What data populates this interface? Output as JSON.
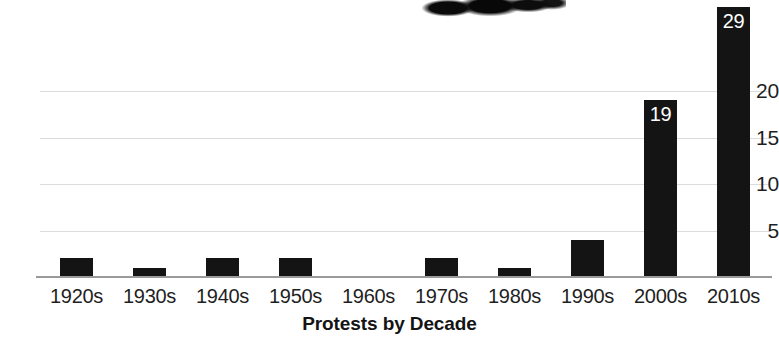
{
  "chart_data": {
    "type": "bar",
    "title": "",
    "xlabel": "Protests by Decade",
    "ylabel": "",
    "categories": [
      "1920s",
      "1930s",
      "1940s",
      "1950s",
      "1960s",
      "1970s",
      "1980s",
      "1990s",
      "2000s",
      "2010s"
    ],
    "values": [
      2,
      1,
      2,
      2,
      0,
      2,
      1,
      4,
      19,
      29
    ],
    "data_labels": [
      "",
      "",
      "",
      "",
      "",
      "",
      "",
      "",
      "19",
      "29"
    ],
    "yticks": [
      5,
      10,
      15,
      20
    ],
    "ytick_labels": [
      "5",
      "10",
      "15",
      "20"
    ],
    "ylim": [
      0,
      30
    ],
    "grid": true,
    "legend": false,
    "bar_color": "#141414",
    "grid_color": "#dcdcdc",
    "axis_color": "#9a9a9a",
    "text_color": "#1f1f1f",
    "data_label_color": "#ffffff"
  },
  "artifact": {
    "name": "ink-blot-scan-artifact"
  }
}
